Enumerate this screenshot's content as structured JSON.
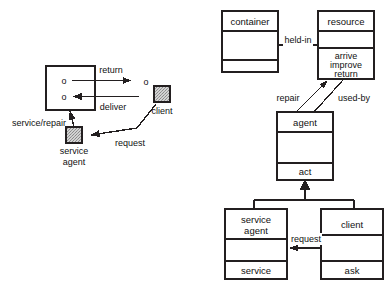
{
  "figure": {
    "background": "#ffffff",
    "line_color": "#231f20",
    "text_color": "#111111",
    "fill_white": "#ffffff",
    "fill_grey": "#c9c9c9"
  },
  "left_diagram": {
    "name": "agent-interaction-scenario",
    "nodes": [
      {
        "id": "main-box",
        "kind": "open-box",
        "label": "",
        "ports": [
          "o",
          "o"
        ]
      },
      {
        "id": "client-node",
        "kind": "grey-square",
        "label": "client"
      },
      {
        "id": "service-agent-node",
        "kind": "grey-square",
        "label": "service\nagent",
        "label_line1": "service",
        "label_line2": "agent"
      },
      {
        "id": "return-port",
        "kind": "circle-marker",
        "label": "o"
      }
    ],
    "edges": [
      {
        "id": "return-edge",
        "label": "return",
        "from": "main-box",
        "to": "return-port",
        "arrow": "filled"
      },
      {
        "id": "deliver-edge",
        "label": "deliver",
        "from": "client",
        "to": "main-box",
        "arrow": "filled"
      },
      {
        "id": "service-repair-edge",
        "label": "service/repair",
        "from": "service-agent-node",
        "to": "main-box",
        "arrow": "filled"
      },
      {
        "id": "request-edge",
        "label": "request",
        "from": "client-node",
        "to": "service-agent-node",
        "arrow": "filled"
      }
    ],
    "labels": {
      "return": "return",
      "deliver": "deliver",
      "service_repair": "service/repair",
      "request": "request",
      "client": "client",
      "service_agent_line1": "service",
      "service_agent_line2": "agent",
      "port_top": "o",
      "port_bottom": "o",
      "port_external": "o"
    }
  },
  "right_diagram": {
    "name": "agent-class-model",
    "classes": [
      {
        "id": "container-class",
        "name": "container",
        "attributes": [],
        "operations": [],
        "compartments": 3
      },
      {
        "id": "resource-class",
        "name": "resource",
        "attributes": [],
        "operations": [
          "arrive",
          "improve",
          "return"
        ],
        "compartments": 3
      },
      {
        "id": "agent-class",
        "name": "agent",
        "attributes": [],
        "operations": [
          "act"
        ],
        "compartments": 3
      },
      {
        "id": "service-agent-class",
        "name": "service agent",
        "name_line1": "service",
        "name_line2": "agent",
        "attributes": [],
        "operations": [
          "service"
        ],
        "compartments": 3
      },
      {
        "id": "client-class",
        "name": "client",
        "attributes": [],
        "operations": [
          "ask"
        ],
        "compartments": 3
      }
    ],
    "associations": [
      {
        "id": "held-in-assoc",
        "label": "held-in",
        "from": "container",
        "to": "resource",
        "arrow": "none"
      },
      {
        "id": "repair-assoc",
        "label": "repair",
        "from": "agent",
        "to": "resource",
        "arrow": "filled"
      },
      {
        "id": "used-by-assoc",
        "label": "used-by",
        "from": "resource",
        "to": "agent",
        "arrow": "none"
      },
      {
        "id": "request-assoc",
        "label": "request",
        "from": "client",
        "to": "service agent",
        "arrow": "filled"
      }
    ],
    "generalizations": [
      {
        "id": "service-agent-generalization",
        "subclass": "service agent",
        "superclass": "agent",
        "arrow": "solid-triangle"
      },
      {
        "id": "client-generalization",
        "subclass": "client",
        "superclass": "agent",
        "arrow": "solid-triangle"
      }
    ],
    "labels": {
      "container": "container",
      "resource": "resource",
      "agent": "agent",
      "client": "client",
      "service_agent_line1": "service",
      "service_agent_line2": "agent",
      "held_in": "held-in",
      "repair": "repair",
      "used_by": "used-by",
      "request": "request",
      "arrive": "arrive",
      "improve": "improve",
      "return": "return",
      "act": "act",
      "service": "service",
      "ask": "ask"
    }
  }
}
